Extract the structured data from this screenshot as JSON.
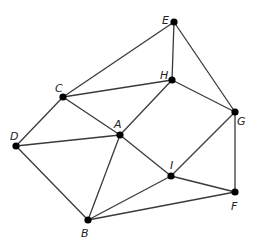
{
  "diagram": {
    "type": "graph",
    "nodes": [
      {
        "id": "A",
        "label": "A",
        "x": 120,
        "y": 135,
        "lx": 114,
        "ly": 128
      },
      {
        "id": "B",
        "label": "B",
        "x": 88,
        "y": 220,
        "lx": 81,
        "ly": 237
      },
      {
        "id": "C",
        "label": "C",
        "x": 63,
        "y": 97,
        "lx": 55,
        "ly": 92
      },
      {
        "id": "D",
        "label": "D",
        "x": 16,
        "y": 146,
        "lx": 10,
        "ly": 140
      },
      {
        "id": "E",
        "label": "E",
        "x": 174,
        "y": 22,
        "lx": 162,
        "ly": 24
      },
      {
        "id": "F",
        "label": "F",
        "x": 235,
        "y": 192,
        "lx": 231,
        "ly": 210
      },
      {
        "id": "G",
        "label": "G",
        "x": 235,
        "y": 112,
        "lx": 237,
        "ly": 125
      },
      {
        "id": "H",
        "label": "H",
        "x": 172,
        "y": 80,
        "lx": 160,
        "ly": 79
      },
      {
        "id": "I",
        "label": "I",
        "x": 171,
        "y": 176,
        "lx": 170,
        "ly": 169
      }
    ],
    "edges": [
      [
        "C",
        "E"
      ],
      [
        "C",
        "H"
      ],
      [
        "C",
        "A"
      ],
      [
        "C",
        "D"
      ],
      [
        "E",
        "H"
      ],
      [
        "E",
        "G"
      ],
      [
        "H",
        "G"
      ],
      [
        "H",
        "A"
      ],
      [
        "D",
        "A"
      ],
      [
        "D",
        "B"
      ],
      [
        "A",
        "B"
      ],
      [
        "A",
        "I"
      ],
      [
        "G",
        "I"
      ],
      [
        "G",
        "F"
      ],
      [
        "I",
        "F"
      ],
      [
        "I",
        "B"
      ],
      [
        "B",
        "F"
      ]
    ]
  }
}
